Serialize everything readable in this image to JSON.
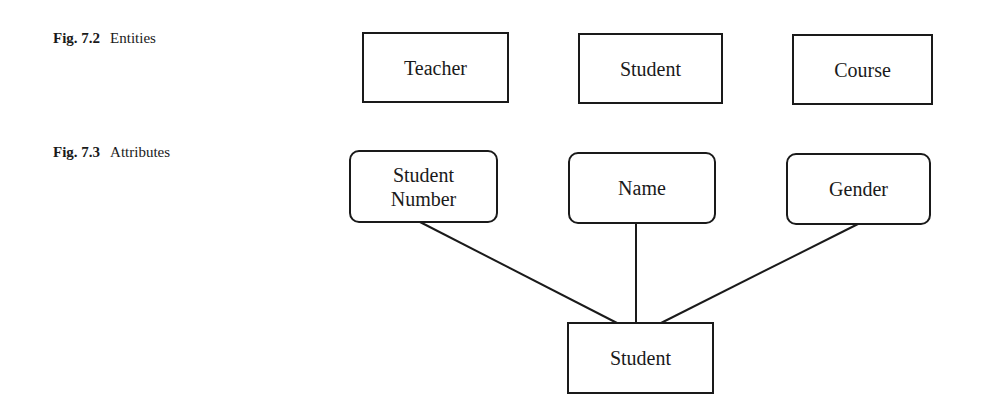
{
  "figures": [
    {
      "caption_number": "Fig. 7.2",
      "caption_text": "Entities",
      "entities": [
        {
          "label": "Teacher",
          "shape": "rectangle"
        },
        {
          "label": "Student",
          "shape": "rectangle"
        },
        {
          "label": "Course",
          "shape": "rectangle"
        }
      ]
    },
    {
      "caption_number": "Fig. 7.3",
      "caption_text": "Attributes",
      "attributes": [
        {
          "label": "Student Number",
          "shape": "rounded-rectangle"
        },
        {
          "label": "Name",
          "shape": "rounded-rectangle"
        },
        {
          "label": "Gender",
          "shape": "rounded-rectangle"
        }
      ],
      "entity": {
        "label": "Student",
        "shape": "rectangle"
      },
      "connections": [
        {
          "from": "Student Number",
          "to": "Student"
        },
        {
          "from": "Name",
          "to": "Student"
        },
        {
          "from": "Gender",
          "to": "Student"
        }
      ]
    }
  ],
  "colors": {
    "line": "#1a1a1a",
    "background": "#ffffff"
  }
}
